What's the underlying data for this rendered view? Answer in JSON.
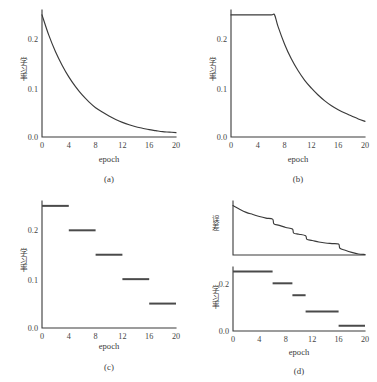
{
  "figure": {
    "background_color": "#ffffff",
    "line_color": "#3a3a3a",
    "panels": [
      {
        "id": "a",
        "caption": "(a)",
        "xlabel": "epoch",
        "ylabel_cjk": "学习率",
        "ylabel_meaning": "learning rate"
      },
      {
        "id": "b",
        "caption": "(b)",
        "xlabel": "epoch",
        "ylabel_cjk": "学习率",
        "ylabel_meaning": "learning rate"
      },
      {
        "id": "c",
        "caption": "(c)",
        "xlabel": "epoch",
        "ylabel_cjk": "学习率",
        "ylabel_meaning": "learning rate"
      },
      {
        "id": "d",
        "caption": "(d)",
        "xlabel": "epoch",
        "ylabel_top_cjk": "误差",
        "ylabel_top_meaning": "error",
        "ylabel_bottom_cjk": "学习率",
        "ylabel_bottom_meaning": "learning rate"
      }
    ]
  },
  "chart_data": [
    {
      "type": "line",
      "panel": "a",
      "title": "(a)",
      "xlabel": "epoch",
      "ylabel": "学习率",
      "xlim": [
        0,
        20
      ],
      "ylim": [
        0.0,
        0.26
      ],
      "xticks": [
        0,
        4,
        8,
        12,
        16,
        20
      ],
      "xticklabels": [
        "0",
        "4",
        "8",
        "12",
        "16",
        "20"
      ],
      "yticks": [
        0.0,
        0.1,
        0.2
      ],
      "yticklabels": [
        "0.0",
        "0.1",
        "0.2"
      ],
      "grid": false,
      "legend": null,
      "description": "Exponential decay of learning rate from epoch 0",
      "x": [
        0,
        1,
        2,
        3,
        4,
        5,
        6,
        7,
        8,
        9,
        10,
        11,
        12,
        13,
        14,
        15,
        16,
        17,
        18,
        19,
        20
      ],
      "y": [
        0.25,
        0.209,
        0.175,
        0.147,
        0.123,
        0.103,
        0.086,
        0.072,
        0.06,
        0.051,
        0.043,
        0.036,
        0.03,
        0.025,
        0.021,
        0.018,
        0.015,
        0.013,
        0.011,
        0.01,
        0.009
      ]
    },
    {
      "type": "line",
      "panel": "b",
      "title": "(b)",
      "xlabel": "epoch",
      "ylabel": "学习率",
      "xlim": [
        0,
        20
      ],
      "ylim": [
        0.0,
        0.26
      ],
      "xticks": [
        0,
        4,
        8,
        12,
        16,
        20
      ],
      "xticklabels": [
        "0",
        "4",
        "8",
        "12",
        "16",
        "20"
      ],
      "yticks": [
        0.0,
        0.1,
        0.2
      ],
      "yticklabels": [
        "0.0",
        "0.1",
        "0.2"
      ],
      "grid": false,
      "legend": null,
      "description": "Constant learning rate 0.25 until epoch 6.5, then exponential decay",
      "x": [
        0,
        2,
        4,
        6,
        6.5,
        7,
        8,
        9,
        10,
        11,
        12,
        13,
        14,
        15,
        16,
        17,
        18,
        19,
        20
      ],
      "y": [
        0.25,
        0.25,
        0.25,
        0.25,
        0.25,
        0.227,
        0.19,
        0.16,
        0.136,
        0.116,
        0.1,
        0.086,
        0.074,
        0.064,
        0.056,
        0.049,
        0.043,
        0.037,
        0.032
      ]
    },
    {
      "type": "line",
      "panel": "c",
      "title": "(c)",
      "xlabel": "epoch",
      "ylabel": "学习率",
      "xlim": [
        0,
        20
      ],
      "ylim": [
        0.0,
        0.26
      ],
      "xticks": [
        0,
        4,
        8,
        12,
        16,
        20
      ],
      "xticklabels": [
        "0",
        "4",
        "8",
        "12",
        "16",
        "20"
      ],
      "yticks": [
        0.0,
        0.1,
        0.2
      ],
      "yticklabels": [
        "0.0",
        "0.1",
        "0.2"
      ],
      "grid": false,
      "legend": null,
      "description": "Piecewise-constant (step) learning rate schedule, drops every 4 epochs",
      "steps": [
        {
          "x_start": 0,
          "x_end": 4,
          "value": 0.25
        },
        {
          "x_start": 4,
          "x_end": 8,
          "value": 0.2
        },
        {
          "x_start": 8,
          "x_end": 12,
          "value": 0.15
        },
        {
          "x_start": 12,
          "x_end": 16,
          "value": 0.1
        },
        {
          "x_start": 16,
          "x_end": 20,
          "value": 0.05
        }
      ]
    },
    {
      "type": "line",
      "panel": "d-top",
      "title": "(d) top",
      "xlabel": "",
      "ylabel": "误差",
      "xlim": [
        0,
        20
      ],
      "ylim": [
        0.0,
        1.0
      ],
      "xticks": [],
      "xticklabels": [],
      "yticks": [],
      "yticklabels": [],
      "grid": false,
      "legend": null,
      "description": "Training error decreasing, with visible drops at each learning-rate reduction",
      "x": [
        0,
        1,
        2,
        3,
        4,
        5,
        6,
        6.2,
        7,
        8,
        9,
        9.2,
        10,
        11,
        11.2,
        12,
        13,
        14,
        15,
        16,
        16.2,
        17,
        18,
        19,
        20
      ],
      "y": [
        0.95,
        0.88,
        0.82,
        0.78,
        0.74,
        0.71,
        0.69,
        0.6,
        0.57,
        0.53,
        0.5,
        0.42,
        0.4,
        0.37,
        0.3,
        0.28,
        0.25,
        0.23,
        0.22,
        0.21,
        0.13,
        0.09,
        0.05,
        0.02,
        0.01
      ]
    },
    {
      "type": "line",
      "panel": "d-bottom",
      "title": "(d) bottom",
      "xlabel": "epoch",
      "ylabel": "学习率",
      "xlim": [
        0,
        20
      ],
      "ylim": [
        0.0,
        0.26
      ],
      "xticks": [
        0,
        4,
        8,
        12,
        16,
        20
      ],
      "xticklabels": [
        "0",
        "4",
        "8",
        "12",
        "16",
        "20"
      ],
      "yticks": [
        0.0,
        0.2
      ],
      "yticklabels": [
        "0.0",
        "0.2"
      ],
      "grid": false,
      "legend": null,
      "description": "Adaptive step learning rate schedule aligned with the error curve above",
      "steps": [
        {
          "x_start": 0,
          "x_end": 6,
          "value": 0.25
        },
        {
          "x_start": 6,
          "x_end": 9,
          "value": 0.2
        },
        {
          "x_start": 9,
          "x_end": 11,
          "value": 0.15
        },
        {
          "x_start": 11,
          "x_end": 16,
          "value": 0.082
        },
        {
          "x_start": 16,
          "x_end": 20,
          "value": 0.022
        }
      ]
    }
  ],
  "labels": {
    "epoch": "epoch",
    "caption_a": "(a)",
    "caption_b": "(b)",
    "caption_c": "(c)",
    "caption_d": "(d)",
    "y_learning_rate": "学习率",
    "y_error": "误差",
    "ytick_0_0": "0.0",
    "ytick_0_1": "0.1",
    "ytick_0_2": "0.2",
    "xtick_0": "0",
    "xtick_4": "4",
    "xtick_8": "8",
    "xtick_12": "12",
    "xtick_16": "16",
    "xtick_20": "20"
  }
}
